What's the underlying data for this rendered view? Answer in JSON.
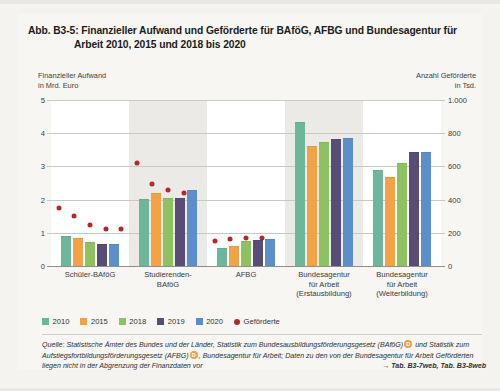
{
  "figure": {
    "title_line1": "Abb. B3-5:  Finanzieller Aufwand und Geförderte für BAföG, AFBG und Bundesagentur für",
    "title_line2": "Arbeit 2010, 2015 und 2018 bis 2020"
  },
  "axes": {
    "left_caption_line1": "Finanzieller Aufwand",
    "left_caption_line2": "in Mrd. Euro",
    "right_caption_line1": "Anzahl Geförderte",
    "right_caption_line2": "in Tsd."
  },
  "legend": {
    "items": [
      {
        "label": "2010",
        "color": "#6cb79b"
      },
      {
        "label": "2015",
        "color": "#f3a246"
      },
      {
        "label": "2018",
        "color": "#8cc25f"
      },
      {
        "label": "2019",
        "color": "#584d77"
      },
      {
        "label": "2020",
        "color": "#5b8fc9"
      }
    ],
    "marker_label": "Geförderte",
    "marker_color": "#b3292b"
  },
  "source": {
    "text_part1": "Quelle: Statistische Ämter des Bundes und der Länder, Statistik zum Bundesausbildungsförderungsgesetz (BAföG)",
    "marker1": "D",
    "text_part2": " und Statistik zum Aufstiegsfortbildungsförderungsgesetz (AFBG)",
    "marker2": "D",
    "text_part3": ", Bundesagentur für Arbeit; Daten zu den von der Bundesagentur für Arbeit Geförderten liegen nicht in der Abgrenzung der Finanzdaten vor",
    "table_ref": "→ Tab. B3-7web, Tab. B3-8web"
  },
  "chart_data": {
    "type": "bar",
    "title": "Finanzieller Aufwand und Geförderte für BAföG, AFBG und Bundesagentur für Arbeit 2010, 2015 und 2018 bis 2020",
    "xlabel": "",
    "ylabel": "Finanzieller Aufwand in Mrd. Euro",
    "y2label": "Anzahl Geförderte in Tsd.",
    "ylim": [
      0,
      5
    ],
    "y2lim": [
      0,
      1000
    ],
    "yticks": [
      "0",
      "1",
      "2",
      "3",
      "4",
      "5"
    ],
    "y2ticks": [
      "0",
      "200",
      "400",
      "600",
      "800",
      "1.000"
    ],
    "grid": true,
    "legend_position": "bottom-left",
    "categories": [
      "Schüler-BAföG",
      "Studierenden-BAföG",
      "AFBG",
      "Bundesagentur für Arbeit (Erstausbildung)",
      "Bundesagentur für Arbeit (Weiterbildung)"
    ],
    "category_labels_wrapped": [
      [
        "Schüler-BAföG"
      ],
      [
        "Studierenden-",
        "BAföG"
      ],
      [
        "AFBG"
      ],
      [
        "Bundesagentur",
        "für Arbeit",
        "(Erstausbildung)"
      ],
      [
        "Bundesagentur",
        "für Arbeit",
        "(Weiterbildung)"
      ]
    ],
    "series": [
      {
        "name": "2010",
        "color": "#6cb79b",
        "values": [
          0.88,
          2.0,
          0.52,
          4.3,
          2.85
        ]
      },
      {
        "name": "2015",
        "color": "#f3a246",
        "values": [
          0.82,
          2.18,
          0.58,
          3.58,
          2.65
        ]
      },
      {
        "name": "2018",
        "color": "#8cc25f",
        "values": [
          0.7,
          2.02,
          0.72,
          3.72,
          3.08
        ]
      },
      {
        "name": "2019",
        "color": "#584d77",
        "values": [
          0.64,
          2.03,
          0.74,
          3.8,
          3.4
        ]
      },
      {
        "name": "2020",
        "color": "#5b8fc9",
        "values": [
          0.64,
          2.25,
          0.78,
          3.82,
          3.4
        ]
      }
    ],
    "marker_series": {
      "name": "Geförderte",
      "color": "#b3292b",
      "unit": "Tsd.",
      "values": [
        [
          352,
          300,
          246,
          222,
          222
        ],
        [
          620,
          492,
          460,
          440,
          null
        ],
        [
          150,
          160,
          166,
          168,
          null
        ],
        [
          null,
          null,
          null,
          null,
          null
        ],
        [
          null,
          null,
          null,
          null,
          null
        ]
      ]
    }
  }
}
